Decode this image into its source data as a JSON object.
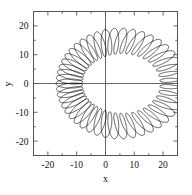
{
  "chart_data": {
    "type": "line",
    "title": "",
    "xlabel": "x",
    "ylabel": "y",
    "xlim": [
      -25,
      25
    ],
    "ylim": [
      -25,
      25
    ],
    "xticks": [
      -20,
      -10,
      0,
      10,
      20
    ],
    "yticks": [
      -20,
      -10,
      0,
      10,
      20
    ],
    "xtick_labels": [
      "-20",
      "-10",
      "0",
      "10",
      "20"
    ],
    "ytick_labels": [
      "-20",
      "-10",
      "0",
      "10",
      "20"
    ],
    "grid": false,
    "legend": null,
    "zero_axes": true,
    "series": [
      {
        "name": "trajectory",
        "description": "fast small-amplitude oscillation superposed on a slowly precessing egg-shaped orbit, tracing a dense annular band",
        "color": "#000000",
        "linewidth": 0.7,
        "curve_model": "epitrochoid-like: slow egg-shaped guiding orbit modulated by fast radial oscillation",
        "guide_orbit": {
          "center_x": 1.5,
          "center_y": 0.0,
          "semi_major_x": 21.0,
          "semi_minor_y": 15.5,
          "egg_skew": 0.22
        },
        "oscillation": {
          "cycles": 46,
          "radial_amplitude": 4.6,
          "tangential_amplitude": 1.2
        },
        "extent_x": [
          -23.0,
          26.0
        ],
        "extent_y": [
          -18.0,
          18.0
        ],
        "inner_hole_x": [
          -12.0,
          12.0
        ],
        "inner_hole_y": [
          -7.5,
          7.5
        ]
      }
    ]
  },
  "axes": {
    "x_title": "x",
    "y_title": "y"
  }
}
